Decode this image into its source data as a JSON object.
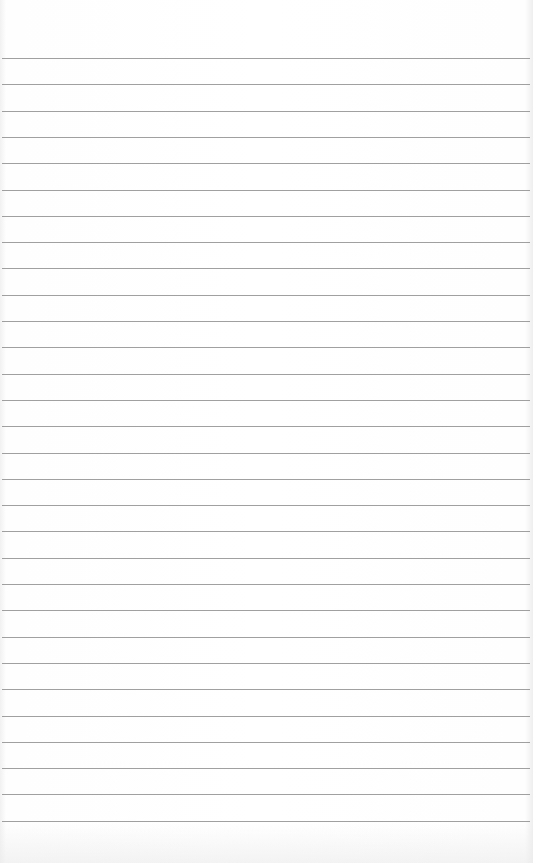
{
  "paper": {
    "type": "lined-paper",
    "background_color": "#ffffff",
    "rule_color": "#8f8f8f",
    "rule_count": 30,
    "first_rule_y": 58,
    "rule_spacing": 26.3,
    "rule_left": 2,
    "rule_width": 528
  }
}
